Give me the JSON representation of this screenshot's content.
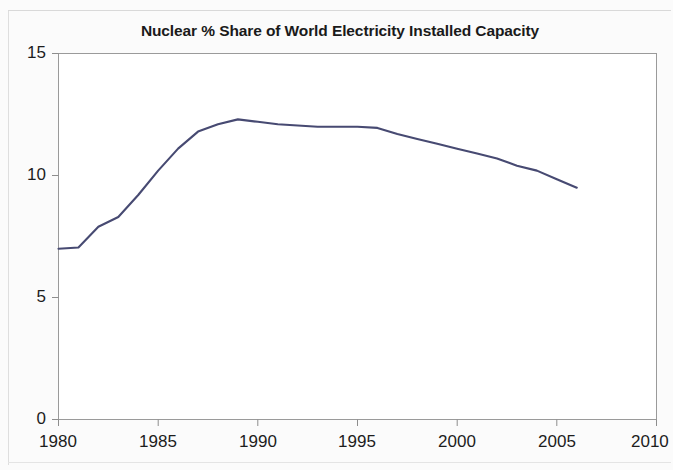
{
  "chart_data": {
    "type": "line",
    "title": "Nuclear % Share of World Electricity Installed Capacity",
    "xlabel": "",
    "ylabel": "",
    "xlim": [
      1980,
      2010
    ],
    "ylim": [
      0,
      15
    ],
    "xticks": [
      1980,
      1985,
      1990,
      1995,
      2000,
      2005,
      2010
    ],
    "xtick_labels": [
      "1980",
      "1985",
      "1990",
      "1995",
      "2000",
      "2005",
      "2010"
    ],
    "yticks": [
      0,
      5,
      10,
      15
    ],
    "ytick_labels": [
      "0",
      "5",
      "10",
      "15"
    ],
    "grid": false,
    "legend": null,
    "line_color": "#474a72",
    "series": [
      {
        "name": "Nuclear % share of world electricity installed capacity",
        "x": [
          1980,
          1981,
          1982,
          1983,
          1984,
          1985,
          1986,
          1987,
          1988,
          1989,
          1990,
          1991,
          1992,
          1993,
          1994,
          1995,
          1996,
          1997,
          1998,
          1999,
          2000,
          2001,
          2002,
          2003,
          2004,
          2005,
          2006
        ],
        "values": [
          7.0,
          7.05,
          7.9,
          8.3,
          9.2,
          10.2,
          11.1,
          11.8,
          12.1,
          12.3,
          12.2,
          12.1,
          12.05,
          12.0,
          12.0,
          12.0,
          11.95,
          11.7,
          11.5,
          11.3,
          11.1,
          10.9,
          10.7,
          10.4,
          10.2,
          9.85,
          9.5
        ]
      }
    ],
    "cut_off_note": "right-most x tick label 2010 is clipped by the image edge"
  },
  "axes": {
    "title": "Nuclear % Share of World Electricity Installed Capacity"
  }
}
